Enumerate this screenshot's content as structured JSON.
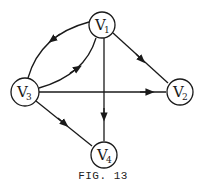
{
  "figure": {
    "caption": "FIG. 13",
    "stroke_color": "#1a1a1a"
  },
  "nodes": [
    {
      "id": "V1",
      "letter": "V",
      "sub": "1",
      "cx": 102,
      "cy": 25
    },
    {
      "id": "V2",
      "letter": "V",
      "sub": "2",
      "cx": 180,
      "cy": 92
    },
    {
      "id": "V3",
      "letter": "V",
      "sub": "3",
      "cx": 25,
      "cy": 92
    },
    {
      "id": "V4",
      "letter": "V",
      "sub": "4",
      "cx": 104,
      "cy": 155
    }
  ],
  "edges": [
    {
      "from": "V1",
      "to": "V3",
      "style": "curved-outer"
    },
    {
      "from": "V3",
      "to": "V1",
      "style": "curved-inner"
    },
    {
      "from": "V1",
      "to": "V2",
      "style": "straight"
    },
    {
      "from": "V1",
      "to": "V4",
      "style": "straight"
    },
    {
      "from": "V3",
      "to": "V2",
      "style": "straight"
    },
    {
      "from": "V3",
      "to": "V4",
      "style": "straight"
    }
  ]
}
